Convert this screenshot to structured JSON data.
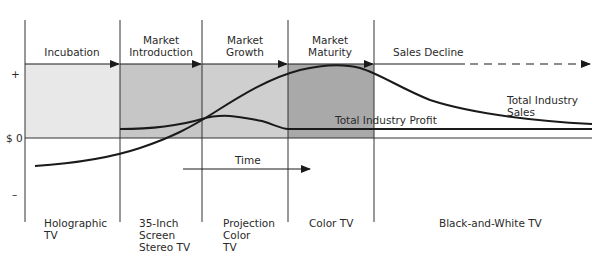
{
  "stages": [
    {
      "label": "Incubation",
      "product": "Holographic\nTV"
    },
    {
      "label": "Market\nIntroduction",
      "product": "35-Inch\nScreen\nStereo TV"
    },
    {
      "label": "Market\nGrowth",
      "product": "Projection\nColor\nTV"
    },
    {
      "label": "Market\nMaturity",
      "product": "Color TV"
    },
    {
      "label": "Sales Decline",
      "product": "Black-and-White TV"
    }
  ],
  "axis": {
    "plus": "+",
    "zero": "$ 0",
    "minus": "–"
  },
  "curves": {
    "sales_label": "Total Industry Sales",
    "profit_label": "Total Industry Profit"
  },
  "time_label": "Time",
  "colors": {
    "incubation_fill": "#e6e6e6",
    "intro_fill": "#c4c4c4",
    "growth_fill": "#cdcdcd",
    "maturity_fill": "#a8a8a8",
    "line": "#1a1a1a"
  }
}
